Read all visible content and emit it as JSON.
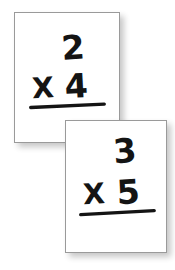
{
  "scene": {
    "description": "Two overlapping white multiplication flashcards",
    "background_color": "#ffffff",
    "card_face_color": "#ffffff",
    "card_border_color": "#9a9a9a",
    "ink_color": "#141414",
    "shadow_color": "#000000"
  },
  "cards": [
    {
      "id": "flashcard-1",
      "multiplicand": "2",
      "operator": "X",
      "multiplier": "4",
      "problem": "2 X 4",
      "answer": "",
      "has_answer_line": true
    },
    {
      "id": "flashcard-2",
      "multiplicand": "3",
      "operator": "X",
      "multiplier": "5",
      "problem": "3 X 5",
      "answer": "",
      "has_answer_line": true
    }
  ]
}
